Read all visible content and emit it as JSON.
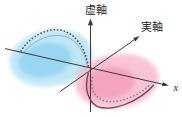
{
  "diagram": {
    "background": "#ffffff",
    "axis_color": "#3a3a3a",
    "axes": {
      "vertical": {
        "label": "虚軸"
      },
      "real": {
        "label": "実軸"
      },
      "horizontal": {
        "label": "x"
      }
    },
    "lobes": {
      "blue": {
        "fill": "#8ed4f0",
        "core_fill": "#7fccee",
        "dotted_color": "#454e57",
        "solid_color": "#7fa3b5"
      },
      "pink": {
        "fill": "#f49cba",
        "core_fill": "#f28bad",
        "dotted_color": "#93707b",
        "solid_color": "#6a4452"
      }
    }
  }
}
